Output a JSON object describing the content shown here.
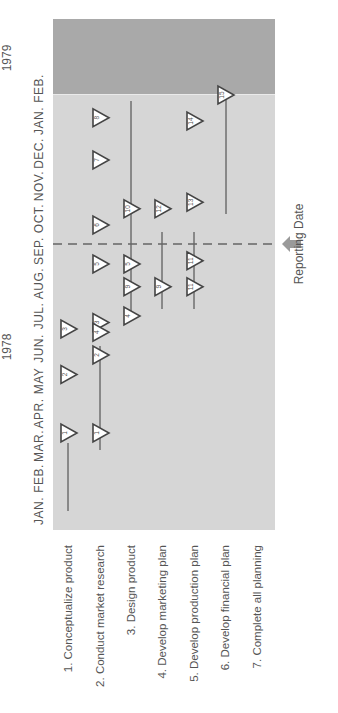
{
  "chart_data": {
    "type": "gantt-milestone",
    "title": "",
    "years": [
      {
        "label": "1978",
        "span": [
          "JAN.",
          "DEC."
        ]
      },
      {
        "label": "1979",
        "span": [
          "JAN.",
          "FEB."
        ]
      }
    ],
    "months": [
      "JAN.",
      "FEB.",
      "MAR.",
      "APR.",
      "MAY",
      "JUN.",
      "JUL.",
      "AUG.",
      "SEP.",
      "OCT.",
      "NOV.",
      "DEC.",
      "JAN.",
      "FEB."
    ],
    "tasks": [
      {
        "id": 1,
        "label": "1. Conceptualize product"
      },
      {
        "id": 2,
        "label": "2. Conduct market research"
      },
      {
        "id": 3,
        "label": "3. Design product"
      },
      {
        "id": 4,
        "label": "4. Develop marketing plan"
      },
      {
        "id": 5,
        "label": "5. Develop production plan"
      },
      {
        "id": 6,
        "label": "6. Develop financial plan"
      },
      {
        "id": 7,
        "label": "7. Complete all planning"
      }
    ],
    "reporting_date": {
      "label": "Reporting Date",
      "month_index": 8.2
    },
    "milestones": [
      {
        "row": 1,
        "month_index": 2.4,
        "number": "1",
        "dir": "start"
      },
      {
        "row": 2,
        "month_index": 2.4,
        "number": "1",
        "dir": "end"
      },
      {
        "row": 1,
        "month_index": 4.2,
        "number": "2",
        "dir": "start"
      },
      {
        "row": 2,
        "month_index": 4.8,
        "number": "2",
        "dir": "end"
      },
      {
        "row": 1,
        "month_index": 5.6,
        "number": "3",
        "dir": "start"
      },
      {
        "row": 2,
        "month_index": 5.8,
        "number": "3",
        "dir": "end"
      },
      {
        "row": 2,
        "month_index": 5.5,
        "number": "4",
        "dir": "start"
      },
      {
        "row": 3,
        "month_index": 6.0,
        "number": "4",
        "dir": "end"
      },
      {
        "row": 2,
        "month_index": 7.6,
        "number": "5",
        "dir": "start"
      },
      {
        "row": 3,
        "month_index": 7.6,
        "number": "5",
        "dir": "end"
      },
      {
        "row": 3,
        "month_index": 6.9,
        "number": "9",
        "dir": "start"
      },
      {
        "row": 4,
        "month_index": 6.9,
        "number": "9",
        "dir": "end"
      },
      {
        "row": 5,
        "month_index": 6.9,
        "number": "11",
        "dir": "start"
      },
      {
        "row": 5,
        "month_index": 7.7,
        "number": "11",
        "dir": "end"
      },
      {
        "row": 2,
        "month_index": 8.8,
        "number": "6",
        "dir": "start"
      },
      {
        "row": 3,
        "month_index": 9.3,
        "number": "10",
        "dir": "start"
      },
      {
        "row": 4,
        "month_index": 9.3,
        "number": "12",
        "dir": "start"
      },
      {
        "row": 5,
        "month_index": 9.5,
        "number": "13",
        "dir": "start"
      },
      {
        "row": 2,
        "month_index": 10.8,
        "number": "7",
        "dir": "start"
      },
      {
        "row": 2,
        "month_index": 12.1,
        "number": "8",
        "dir": "start"
      },
      {
        "row": 5,
        "month_index": 12.0,
        "number": "14",
        "dir": "start"
      },
      {
        "row": 6,
        "month_index": 12.8,
        "number": "15",
        "dir": "start"
      }
    ],
    "xlabel": "",
    "ylabel": "",
    "grid": false
  },
  "labels": {
    "year_1978": "1978",
    "year_1979": "1979",
    "reporting_date": "Reporting Date"
  },
  "colors": {
    "panel_1978": "#d6d6d6",
    "panel_1979": "#a9a9a9",
    "line": "#555555",
    "arrow": "#9a9a9a"
  }
}
